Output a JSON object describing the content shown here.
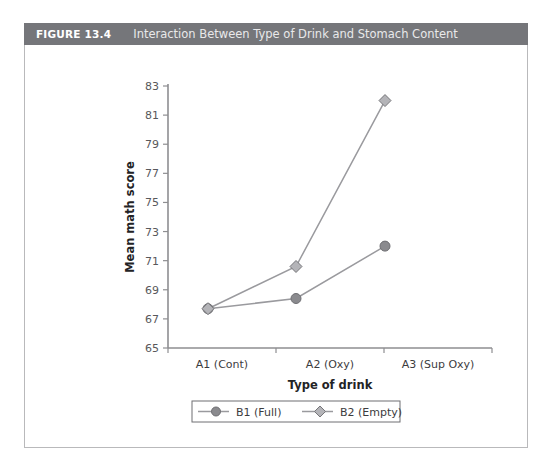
{
  "figure": {
    "number_label": "FIGURE 13.4",
    "title": "Interaction Between Type of Drink and Stomach Content",
    "header_color": "#75767a",
    "border_color": "#b9b9bb"
  },
  "chart_data": {
    "type": "line",
    "title": "Interaction Between Type of Drink and Stomach Content",
    "xlabel": "Type of drink",
    "ylabel": "Mean math score",
    "categories": [
      "A1 (Cont)",
      "A2 (Oxy)",
      "A3 (Sup Oxy)"
    ],
    "series": [
      {
        "name": "B1 (Full)",
        "values": [
          67.7,
          68.4,
          72.0
        ],
        "marker": "circle",
        "color": "#8a8a8e"
      },
      {
        "name": "B2 (Empty)",
        "values": [
          67.7,
          70.6,
          82.0
        ],
        "marker": "diamond",
        "color": "#b4b4b8"
      }
    ],
    "ylim": [
      65,
      83
    ],
    "ytick_step": 2,
    "yticks": [
      "65",
      "67",
      "69",
      "71",
      "73",
      "75",
      "77",
      "79",
      "81",
      "83"
    ],
    "grid": false,
    "legend_position": "bottom"
  },
  "legend": {
    "entries": [
      {
        "label": "B1 (Full)",
        "marker": "circle"
      },
      {
        "label": "B2 (Empty)",
        "marker": "diamond"
      }
    ]
  }
}
